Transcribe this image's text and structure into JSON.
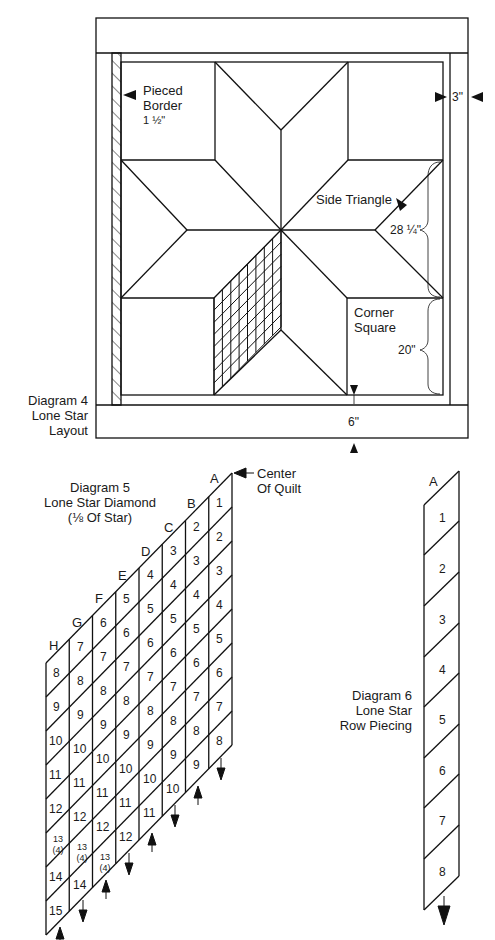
{
  "diagram4": {
    "title_lines": [
      "Diagram 4",
      "Lone Star",
      "Layout"
    ],
    "labels": {
      "pieced_border": [
        "Pieced",
        "Border",
        "1 ½\""
      ],
      "border_width": "3\"",
      "side_triangle": "Side Triangle",
      "side_triangle_size": "28 ¼\"",
      "corner_square": [
        "Corner",
        "Square"
      ],
      "corner_square_size": "20\"",
      "bottom_border": "6\""
    },
    "colors": {
      "line": "#111111",
      "background": "#ffffff"
    }
  },
  "diagram5": {
    "title_lines": [
      "Diagram 5",
      "Lone Star Diamond",
      "(⅛ Of Star)"
    ],
    "center_label": [
      "Center",
      "Of Quilt"
    ],
    "columns": [
      {
        "letter": "A",
        "cells": [
          "1",
          "2",
          "3",
          "4",
          "5",
          "6",
          "7",
          "8"
        ]
      },
      {
        "letter": "B",
        "cells": [
          "2",
          "3",
          "4",
          "5",
          "6",
          "7",
          "8",
          "9"
        ]
      },
      {
        "letter": "C",
        "cells": [
          "3",
          "4",
          "5",
          "6",
          "7",
          "8",
          "9",
          "10"
        ]
      },
      {
        "letter": "D",
        "cells": [
          "4",
          "5",
          "6",
          "7",
          "8",
          "9",
          "10",
          "11"
        ]
      },
      {
        "letter": "E",
        "cells": [
          "5",
          "6",
          "7",
          "8",
          "9",
          "10",
          "11",
          "12"
        ]
      },
      {
        "letter": "F",
        "cells": [
          "6",
          "7",
          "8",
          "9",
          "10",
          "11",
          "12",
          "13 (4)"
        ]
      },
      {
        "letter": "G",
        "cells": [
          "7",
          "8",
          "9",
          "10",
          "11",
          "12",
          "13 (4)",
          "14"
        ]
      },
      {
        "letter": "H",
        "cells": [
          "8",
          "9",
          "10",
          "11",
          "12",
          "13 (4)",
          "14",
          "15"
        ]
      }
    ],
    "arrow_directions": [
      "down",
      "up",
      "down",
      "up",
      "down",
      "up",
      "down",
      "up"
    ]
  },
  "diagram6": {
    "title_lines": [
      "Diagram 6",
      "Lone Star",
      "Row Piecing"
    ],
    "column_letter": "A",
    "cells": [
      "1",
      "2",
      "3",
      "4",
      "5",
      "6",
      "7",
      "8"
    ],
    "arrow_direction": "down"
  }
}
